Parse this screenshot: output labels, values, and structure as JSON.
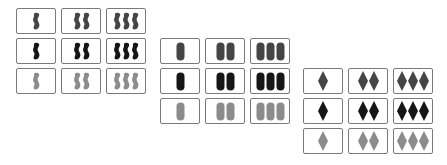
{
  "colors": {
    "medium": "#454545",
    "dark": "#161616",
    "light": "#8c8c8c",
    "border": "#7a7a7a"
  },
  "groups": [
    {
      "name": "squiggle-group",
      "shape": "squiggle",
      "position": {
        "left": 16,
        "top": 8
      },
      "rows": [
        {
          "shade": "medium",
          "counts": [
            1,
            2,
            3
          ]
        },
        {
          "shade": "dark",
          "counts": [
            1,
            2,
            3
          ]
        },
        {
          "shade": "light",
          "counts": [
            1,
            2,
            3
          ]
        }
      ]
    },
    {
      "name": "oval-group",
      "shape": "oval",
      "position": {
        "left": 160,
        "top": 38
      },
      "rows": [
        {
          "shade": "medium",
          "counts": [
            1,
            2,
            3
          ]
        },
        {
          "shade": "dark",
          "counts": [
            1,
            2,
            3
          ]
        },
        {
          "shade": "light",
          "counts": [
            1,
            2,
            3
          ]
        }
      ]
    },
    {
      "name": "diamond-group",
      "shape": "diamond",
      "position": {
        "left": 303,
        "top": 68
      },
      "rows": [
        {
          "shade": "medium",
          "counts": [
            1,
            2,
            3
          ]
        },
        {
          "shade": "dark",
          "counts": [
            1,
            2,
            3
          ]
        },
        {
          "shade": "light",
          "counts": [
            1,
            2,
            3
          ]
        }
      ]
    }
  ]
}
